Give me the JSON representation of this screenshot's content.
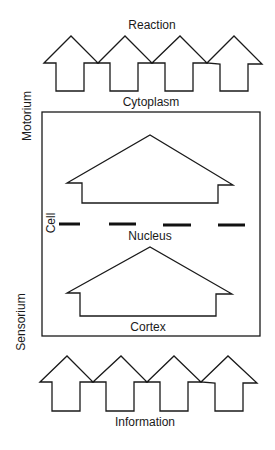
{
  "diagram": {
    "labels": {
      "top": "Reaction",
      "cytoplasm": "Cytoplasm",
      "left_top": "Motorium",
      "cell": "Cell",
      "nucleus": "Nucleus",
      "cortex": "Cortex",
      "left_bottom": "Sensorium",
      "bottom": "Information"
    },
    "top_arrows": {
      "count": 4,
      "direction": "up"
    },
    "bottom_arrows": {
      "count": 4,
      "direction": "up"
    },
    "cell_box": {
      "inner_shapes": [
        "upper-house-arrow",
        "lower-house-arrow"
      ],
      "divider": "dashed nucleus membrane"
    },
    "colors": {
      "stroke": "#1a1a1a",
      "background": "#ffffff"
    }
  }
}
